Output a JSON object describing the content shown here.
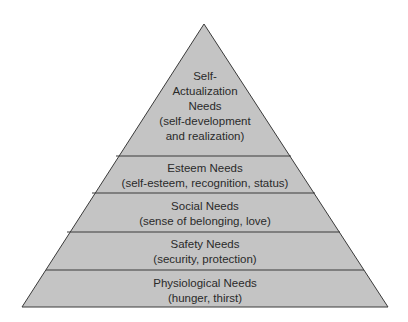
{
  "diagram": {
    "type": "pyramid",
    "fill_color": "#c4c4c4",
    "stroke_color": "#3a3a3a",
    "levels": [
      {
        "lines": [
          "Self-",
          "Actualization",
          "Needs",
          "(self-development",
          "and realization)"
        ]
      },
      {
        "lines": [
          "Esteem Needs",
          "(self-esteem, recognition, status)"
        ]
      },
      {
        "lines": [
          "Social Needs",
          "(sense of belonging, love)"
        ]
      },
      {
        "lines": [
          "Safety Needs",
          "(security, protection)"
        ]
      },
      {
        "lines": [
          "Physiological Needs",
          "(hunger, thirst)"
        ]
      }
    ]
  }
}
